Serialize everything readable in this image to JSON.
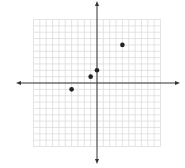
{
  "chart_data": {
    "type": "scatter",
    "title": "",
    "xlabel": "",
    "ylabel": "",
    "xlim": [
      -10,
      10
    ],
    "ylim": [
      -10,
      10
    ],
    "grid": true,
    "grid_step": 1,
    "axes_arrows": true,
    "series": [
      {
        "name": "points",
        "color": "#222222",
        "points": [
          {
            "x": -4,
            "y": -1
          },
          {
            "x": -1,
            "y": 1
          },
          {
            "x": 0,
            "y": 2
          },
          {
            "x": 4,
            "y": 6
          }
        ]
      }
    ],
    "colors": {
      "grid": "#d9d9d9",
      "axis": "#333333",
      "point": "#222222"
    }
  }
}
